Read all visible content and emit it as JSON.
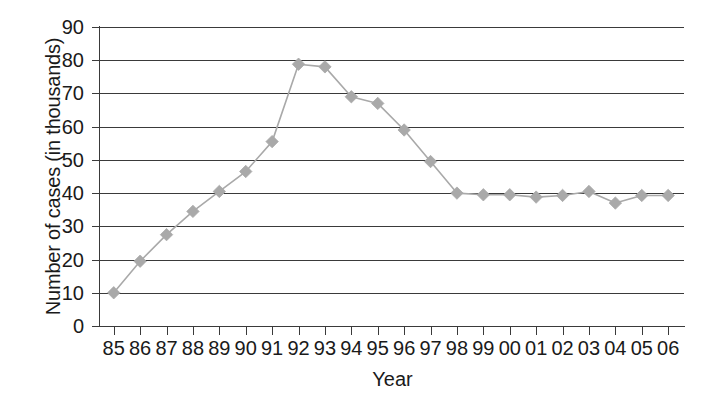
{
  "chart_data": {
    "type": "line",
    "title": "",
    "xlabel": "Year",
    "ylabel": "Number of cases (in thousands)",
    "categories": [
      "85",
      "86",
      "87",
      "88",
      "89",
      "90",
      "91",
      "92",
      "93",
      "94",
      "95",
      "96",
      "97",
      "98",
      "99",
      "00",
      "01",
      "02",
      "03",
      "04",
      "05",
      "06"
    ],
    "values": [
      10,
      19.5,
      27.5,
      34.5,
      40.5,
      46.5,
      55.5,
      78.8,
      78,
      69,
      67,
      59,
      49.5,
      40,
      39.5,
      39.5,
      38.8,
      39.3,
      40.5,
      37,
      39.3,
      39.3
    ],
    "series": [
      {
        "name": "Number of cases",
        "values": [
          10,
          19.5,
          27.5,
          34.5,
          40.5,
          46.5,
          55.5,
          78.8,
          78,
          69,
          67,
          59,
          49.5,
          40,
          39.5,
          39.5,
          38.8,
          39.3,
          40.5,
          37,
          39.3,
          39.3
        ]
      }
    ],
    "ylim": [
      0,
      90
    ],
    "y_ticks": [
      "0",
      "10",
      "20",
      "30",
      "40",
      "50",
      "60",
      "70",
      "80",
      "90"
    ],
    "grid": true,
    "legend": "none",
    "marker": "diamond",
    "marker_color": "#a9a9a9",
    "line_color": "#a9a9a9",
    "axis_color": "#3a3a3a",
    "background": "#ffffff"
  }
}
